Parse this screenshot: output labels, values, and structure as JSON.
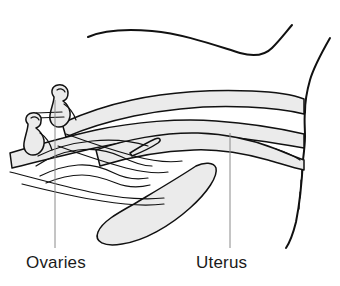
{
  "figure": {
    "background_color": "#ffffff",
    "ink_color": "#111111",
    "fill_color": "#ebebeb",
    "leader_color": "#8a8a8a",
    "width": 340,
    "height": 286
  },
  "labels": [
    {
      "id": "ovaries",
      "text": "Ovaries",
      "x": 26,
      "y": 268,
      "leader": {
        "x": 55,
        "y1": 100,
        "y2": 248
      }
    },
    {
      "id": "uterus",
      "text": "Uterus",
      "x": 196,
      "y": 268,
      "leader": {
        "x": 230,
        "y1": 133,
        "y2": 248
      }
    }
  ],
  "structures": [
    {
      "id": "dorsal-contour",
      "name": "dorsal-body-contour"
    },
    {
      "id": "body-wall",
      "name": "posterior-body-wall"
    },
    {
      "id": "upper-tube",
      "name": "upper-uterine-horn"
    },
    {
      "id": "lower-tube",
      "name": "uterine-body"
    },
    {
      "id": "bladder",
      "name": "bladder"
    },
    {
      "id": "ovary-upper",
      "name": "ovary-upper"
    },
    {
      "id": "ovary-lower",
      "name": "ovary-lower"
    },
    {
      "id": "wavy-horns",
      "name": "coiled-uterine-horns"
    },
    {
      "id": "cervix",
      "name": "cervix-region"
    }
  ]
}
